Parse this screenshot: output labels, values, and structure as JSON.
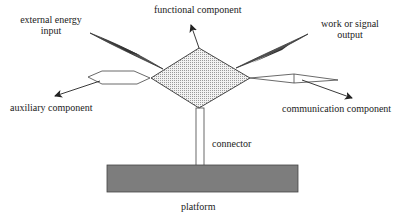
{
  "diagram": {
    "labels": {
      "functional_component": "functional component",
      "external_energy_input_line1": "external energy",
      "external_energy_input_line2": "input",
      "work_output_line1": "work or signal",
      "work_output_line2": "output",
      "auxiliary_component": "auxiliary component",
      "communication_component": "communication component",
      "connector": "connector",
      "platform": "platform"
    },
    "colors": {
      "stroke": "#333333",
      "platform_fill": "#7a7a7a",
      "diamond_fill": "#e6e6e6",
      "energy_fill": "#555555"
    }
  }
}
